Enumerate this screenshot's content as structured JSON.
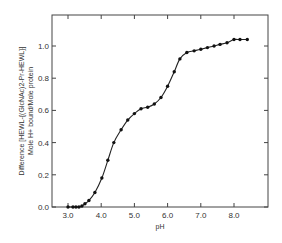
{
  "chart_data": {
    "type": "line",
    "title": "",
    "xlabel": "pH",
    "ylabel_line1": "Difference [HEWL-{(GlcNAc)2-Pr-HEWL}]",
    "ylabel_line2": "Mole H+ bound/Mole protein",
    "xlim": [
      2.5,
      9.0
    ],
    "ylim": [
      0.0,
      1.2
    ],
    "x_ticks": [
      "3.0",
      "4.0",
      "5.0",
      "6.0",
      "7.0",
      "8.0"
    ],
    "y_ticks": [
      "0.0",
      "0.2",
      "0.4",
      "0.6",
      "0.8",
      "1.0"
    ],
    "grid": false,
    "legend": null,
    "series": [
      {
        "name": "Difference",
        "x": [
          3.0,
          3.15,
          3.24,
          3.33,
          3.42,
          3.51,
          3.63,
          3.81,
          4.02,
          4.2,
          4.38,
          4.6,
          4.8,
          5.0,
          5.2,
          5.4,
          5.6,
          5.8,
          6.0,
          6.2,
          6.37,
          6.58,
          6.8,
          7.0,
          7.2,
          7.4,
          7.58,
          7.79,
          8.0,
          8.18,
          8.4
        ],
        "y": [
          0.0,
          0.0,
          0.0,
          0.0,
          0.006,
          0.02,
          0.04,
          0.09,
          0.18,
          0.29,
          0.4,
          0.48,
          0.54,
          0.58,
          0.61,
          0.62,
          0.64,
          0.68,
          0.75,
          0.84,
          0.92,
          0.96,
          0.97,
          0.98,
          0.99,
          1.0,
          1.01,
          1.02,
          1.04,
          1.04,
          1.04
        ]
      }
    ]
  }
}
